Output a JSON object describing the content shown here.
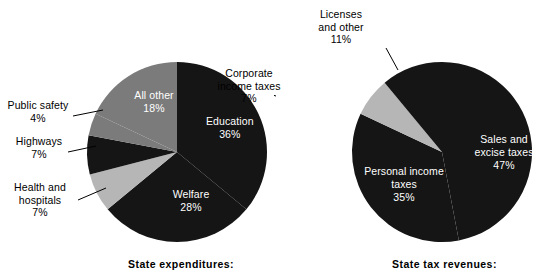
{
  "figure": {
    "width": 547,
    "height": 274,
    "background": "#ffffff"
  },
  "colors": {
    "dark": "#151515",
    "medium_gray": "#7b7b7b",
    "light_gray": "#b6b6b6",
    "label_text": "#000000",
    "inside_label_text": "#ffffff",
    "leader_line": "#000000"
  },
  "panels": [
    {
      "id": "expenditures",
      "caption": "State expenditures:",
      "chart_data": {
        "type": "pie",
        "title": "State expenditures:",
        "unit": "percent",
        "start_angle_deg": 0,
        "direction": "clockwise",
        "categories": [
          "Education",
          "Welfare",
          "Health and hospitals",
          "Highways",
          "Public safety",
          "All other"
        ],
        "values": [
          36,
          28,
          7,
          7,
          4,
          18
        ],
        "slices": [
          {
            "label": "Education",
            "value": 36,
            "display": "36%",
            "color": "#151515",
            "label_position": "inside"
          },
          {
            "label": "Welfare",
            "value": 28,
            "display": "28%",
            "color": "#151515",
            "label_position": "inside"
          },
          {
            "label": "Health and hospitals",
            "value": 7,
            "display": "7%",
            "color": "#b6b6b6",
            "label_position": "outside"
          },
          {
            "label": "Highways",
            "value": 7,
            "display": "7%",
            "color": "#151515",
            "label_position": "outside"
          },
          {
            "label": "Public safety",
            "value": 4,
            "display": "4%",
            "color": "#7b7b7b",
            "label_position": "outside"
          },
          {
            "label": "All other",
            "value": 18,
            "display": "18%",
            "color": "#7b7b7b",
            "label_position": "inside"
          }
        ]
      },
      "labels": {
        "education": {
          "name": "Education",
          "value": "36%"
        },
        "welfare": {
          "name": "Welfare",
          "value": "28%"
        },
        "all_other": {
          "name": "All other",
          "value": "18%"
        },
        "public_safety": {
          "name": "Public safety",
          "value": "4%"
        },
        "highways": {
          "name": "Highways",
          "value": "7%"
        },
        "health_line1": "Health and",
        "health_line2": "hospitals",
        "health_value": "7%"
      }
    },
    {
      "id": "revenues",
      "caption": "State tax revenues:",
      "chart_data": {
        "type": "pie",
        "title": "State tax revenues:",
        "unit": "percent",
        "start_angle_deg": 0,
        "direction": "clockwise",
        "categories": [
          "Sales and excise taxes",
          "Personal income taxes",
          "Corporate income taxes",
          "Licenses and other"
        ],
        "values": [
          47,
          35,
          7,
          11
        ],
        "slices": [
          {
            "label": "Sales and excise taxes",
            "value": 47,
            "display": "47%",
            "color": "#151515",
            "label_position": "inside"
          },
          {
            "label": "Personal income taxes",
            "value": 35,
            "display": "35%",
            "color": "#151515",
            "label_position": "inside"
          },
          {
            "label": "Corporate income taxes",
            "value": 7,
            "display": "7%",
            "color": "#b6b6b6",
            "label_position": "outside"
          },
          {
            "label": "Licenses and other",
            "value": 11,
            "display": "11%",
            "color": "#151515",
            "label_position": "outside"
          }
        ]
      },
      "labels": {
        "sales_line1": "Sales and",
        "sales_line2": "excise taxes",
        "sales_value": "47%",
        "personal_line1": "Personal income",
        "personal_line2": "taxes",
        "personal_value": "35%",
        "corporate_line1": "Corporate",
        "corporate_line2": "income taxes",
        "corporate_value": "7%",
        "licenses_line1": "Licenses",
        "licenses_line2": "and other",
        "licenses_value": "11%"
      }
    }
  ]
}
